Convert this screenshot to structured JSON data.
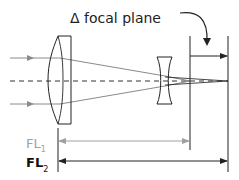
{
  "diagram": {
    "title_label": "Δ focal plane",
    "fl1_label": "FL",
    "fl1_sub": "1",
    "fl2_label": "FL",
    "fl2_sub": "2",
    "colors": {
      "line": "#222222",
      "ray": "#8a8a8a",
      "fl1": "#a0a0a0",
      "fl2": "#111111",
      "background": "#ffffff"
    },
    "elements": [
      {
        "name": "positive-lens",
        "type": "plano-convex lens"
      },
      {
        "name": "negative-lens",
        "type": "biconcave lens"
      },
      {
        "name": "focal-plane-1",
        "type": "vertical line"
      },
      {
        "name": "focal-plane-2",
        "type": "vertical line"
      },
      {
        "name": "optical-axis",
        "type": "dashed line"
      }
    ]
  }
}
